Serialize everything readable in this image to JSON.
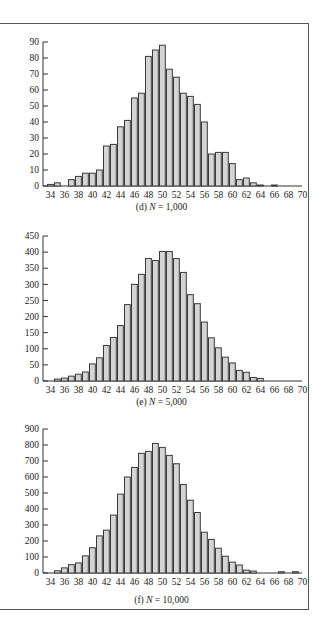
{
  "chart_data": [
    {
      "type": "bar",
      "id": "d",
      "title": "(d) N = 1,000",
      "caption_prefix": "(d) ",
      "caption_var": "N",
      "caption_value": " = 1,000",
      "xlabel": "",
      "ylabel": "",
      "categories": [
        34,
        35,
        36,
        37,
        38,
        39,
        40,
        41,
        42,
        43,
        44,
        45,
        46,
        47,
        48,
        49,
        50,
        51,
        52,
        53,
        54,
        55,
        56,
        57,
        58,
        59,
        60,
        61,
        62,
        63,
        64,
        65,
        66,
        67,
        68,
        69,
        70
      ],
      "x_tick_labels": [
        "34",
        "36",
        "38",
        "40",
        "42",
        "44",
        "46",
        "48",
        "50",
        "52",
        "54",
        "56",
        "58",
        "60",
        "62",
        "64",
        "66",
        "68",
        "70"
      ],
      "values": [
        1,
        2,
        0,
        4,
        6,
        8,
        8,
        10,
        25,
        26,
        37,
        41,
        55,
        58,
        81,
        85,
        88,
        73,
        68,
        58,
        56,
        51,
        40,
        20,
        21,
        21,
        14,
        4,
        5,
        2,
        0.5,
        0,
        0.5,
        0,
        0,
        0,
        0
      ],
      "ylim": [
        0,
        90
      ],
      "y_ticks": [
        0,
        10,
        20,
        30,
        40,
        50,
        60,
        70,
        80,
        90
      ],
      "grid": false
    },
    {
      "type": "bar",
      "id": "e",
      "title": "(e) N = 5,000",
      "caption_prefix": "(e) ",
      "caption_var": "N",
      "caption_value": " = 5,000",
      "xlabel": "",
      "ylabel": "",
      "categories": [
        34,
        35,
        36,
        37,
        38,
        39,
        40,
        41,
        42,
        43,
        44,
        45,
        46,
        47,
        48,
        49,
        50,
        51,
        52,
        53,
        54,
        55,
        56,
        57,
        58,
        59,
        60,
        61,
        62,
        63,
        64,
        65,
        66,
        67,
        68,
        69,
        70
      ],
      "x_tick_labels": [
        "34",
        "36",
        "38",
        "40",
        "42",
        "44",
        "46",
        "48",
        "50",
        "52",
        "54",
        "56",
        "58",
        "60",
        "62",
        "64",
        "66",
        "68",
        "70"
      ],
      "values": [
        0,
        6,
        9,
        15,
        21,
        28,
        53,
        72,
        110,
        135,
        172,
        237,
        300,
        331,
        380,
        374,
        402,
        402,
        380,
        337,
        268,
        240,
        183,
        134,
        103,
        74,
        56,
        33,
        27,
        11,
        8,
        0,
        0,
        0,
        0,
        0,
        0
      ],
      "ylim": [
        0,
        450
      ],
      "y_ticks": [
        0,
        50,
        100,
        150,
        200,
        250,
        300,
        350,
        400,
        450
      ],
      "grid": false
    },
    {
      "type": "bar",
      "id": "f",
      "title": "(f) N = 10,000",
      "caption_prefix": "(f) ",
      "caption_var": "N",
      "caption_value": " = 10,000",
      "xlabel": "",
      "ylabel": "",
      "categories": [
        34,
        35,
        36,
        37,
        38,
        39,
        40,
        41,
        42,
        43,
        44,
        45,
        46,
        47,
        48,
        49,
        50,
        51,
        52,
        53,
        54,
        55,
        56,
        57,
        58,
        59,
        60,
        61,
        62,
        63,
        64,
        65,
        66,
        67,
        68,
        69,
        70
      ],
      "x_tick_labels": [
        "34",
        "36",
        "38",
        "40",
        "42",
        "44",
        "46",
        "48",
        "50",
        "52",
        "54",
        "56",
        "58",
        "60",
        "62",
        "64",
        "66",
        "68",
        "70"
      ],
      "values": [
        0,
        14,
        32,
        52,
        63,
        107,
        158,
        232,
        268,
        362,
        493,
        600,
        660,
        748,
        760,
        810,
        785,
        735,
        683,
        553,
        455,
        378,
        255,
        210,
        155,
        105,
        68,
        50,
        18,
        12,
        0,
        0,
        0,
        8,
        0,
        8,
        0
      ],
      "ylim": [
        0,
        900
      ],
      "y_ticks": [
        0,
        100,
        200,
        300,
        400,
        500,
        600,
        700,
        800,
        900
      ],
      "grid": false
    }
  ],
  "colors": {
    "bar_fill": "#d4d4d4",
    "bar_stroke": "#3a3a3a",
    "axis": "#333333",
    "text": "#222222",
    "frame": "#555555"
  }
}
